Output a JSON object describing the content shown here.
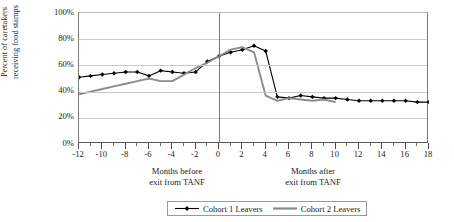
{
  "chart_data": {
    "type": "line",
    "title": "",
    "xlabel_before": "Months before exit from TANF",
    "xlabel_after": "Months after exit from TANF",
    "ylabel_line1": "Percent of  caretakers",
    "ylabel_line2": "receiving food stamps",
    "ylim": [
      0,
      100
    ],
    "xlim": [
      -12,
      18
    ],
    "grid": true,
    "legend_position": "bottom",
    "ytick_labels": [
      "100%",
      "80%",
      "60%",
      "40%",
      "20%",
      "0%"
    ],
    "ytick_values": [
      100,
      80,
      60,
      40,
      20,
      0
    ],
    "xtick_labels": [
      "-12",
      "-10",
      "-8",
      "-6",
      "-4",
      "-2",
      "0",
      "2",
      "4",
      "6",
      "8",
      "10",
      "12",
      "14",
      "16",
      "18"
    ],
    "xtick_values": [
      -12,
      -10,
      -8,
      -6,
      -4,
      -2,
      0,
      2,
      4,
      6,
      8,
      10,
      12,
      14,
      16,
      18
    ],
    "x": [
      -12,
      -11,
      -10,
      -9,
      -8,
      -7,
      -6,
      -5,
      -4,
      -3,
      -2,
      -1,
      0,
      1,
      2,
      3,
      4,
      5,
      6,
      7,
      8,
      9,
      10,
      11,
      12,
      13,
      14,
      15,
      16,
      17,
      18
    ],
    "reference_line_x": 0,
    "series": [
      {
        "name": "Cohort 1 Leavers",
        "color": "#000000",
        "marker": "diamond",
        "values": [
          51,
          52,
          53,
          54,
          55,
          55,
          52,
          56,
          55,
          54,
          55,
          63,
          67,
          70,
          72,
          75,
          71,
          36,
          35,
          37,
          36,
          35,
          35,
          34,
          33,
          33,
          33,
          33,
          33,
          32,
          32
        ]
      },
      {
        "name": "Cohort 2 Leavers",
        "color": "#8c8c8c",
        "marker": "none",
        "values": [
          38,
          40,
          42,
          44,
          46,
          48,
          50,
          48,
          48,
          53,
          58,
          62,
          67,
          72,
          74,
          70,
          37,
          33,
          35,
          34,
          33,
          34,
          32,
          null,
          null,
          null,
          null,
          null,
          null,
          null,
          null
        ]
      }
    ],
    "legend": [
      {
        "label": "Cohort 1 Leavers",
        "color": "#000000",
        "marker": "diamond"
      },
      {
        "label": "Cohort 2 Leavers",
        "color": "#8c8c8c",
        "marker": "none"
      }
    ]
  }
}
